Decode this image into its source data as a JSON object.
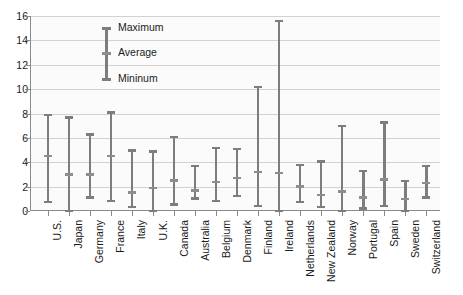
{
  "chart_data": {
    "type": "bar",
    "title": "",
    "subtitle": "",
    "xlabel": "",
    "ylabel": "",
    "ylim": [
      0,
      16
    ],
    "ytick_step": 2,
    "yticks": [
      0,
      2,
      4,
      6,
      8,
      10,
      12,
      14,
      16
    ],
    "grid": true,
    "legend_position": "inside-top-left",
    "legend": [
      "Maximum",
      "Average",
      "Mininum"
    ],
    "legend_sample": {
      "maximum": 15,
      "average": 13,
      "mininum": 11
    },
    "series": [
      {
        "name": "Maximum",
        "values": [
          7.9,
          7.7,
          6.3,
          8.1,
          5.0,
          4.9,
          6.1,
          3.7,
          5.2,
          5.1,
          10.2,
          15.6,
          3.8,
          4.1,
          7.0,
          3.3,
          7.3,
          2.5,
          3.7
        ]
      },
      {
        "name": "Average",
        "values": [
          4.5,
          3.0,
          3.0,
          4.5,
          1.5,
          1.9,
          2.5,
          1.7,
          2.4,
          2.7,
          3.2,
          3.1,
          2.0,
          1.3,
          1.6,
          1.1,
          2.6,
          1.0,
          2.3
        ]
      },
      {
        "name": "Mininum",
        "values": [
          0.7,
          0.0,
          1.1,
          0.8,
          0.3,
          0.0,
          0.5,
          1.0,
          0.8,
          1.2,
          0.4,
          0.0,
          0.7,
          0.3,
          0.0,
          0.2,
          0.4,
          0.0,
          1.1
        ]
      }
    ],
    "categories": [
      "U.S.",
      "Japan",
      "Germany",
      "France",
      "Italy",
      "U.K.",
      "Canada",
      "Australia",
      "Belgium",
      "Denmark",
      "Finland",
      "Ireland",
      "Netherlands",
      "New Zealand",
      "Norway",
      "Portugal",
      "Spain",
      "Sweden",
      "Switzerland"
    ],
    "colors": {
      "marker": "#7d7d7d",
      "average_marker": "#8d8d8d",
      "gridline": "#d2d2d2",
      "axis": "#8a8a8a",
      "plot_background": "#fbfbfb",
      "text": "#1a1a1a"
    }
  }
}
